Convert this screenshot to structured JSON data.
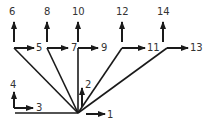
{
  "diagram": {
    "type": "vector-tree",
    "stroke_color": "#1a1a1a",
    "label_color": "#333333",
    "hub": {
      "x": 78,
      "y": 113
    },
    "nodes": [
      {
        "id": "n5",
        "corner": [
          14,
          48
        ],
        "label": "5",
        "h_arrow_to": [
          34,
          48
        ],
        "label_pos": [
          36,
          51
        ],
        "up_label": "6",
        "up_from": [
          14,
          42
        ],
        "up_to": [
          14,
          22
        ],
        "up_label_pos": [
          9,
          15
        ]
      },
      {
        "id": "n7",
        "corner": [
          47,
          48
        ],
        "label": "7",
        "h_arrow_to": [
          68,
          48
        ],
        "label_pos": [
          71,
          51
        ],
        "up_label": "8",
        "up_from": [
          47,
          42
        ],
        "up_to": [
          47,
          22
        ],
        "up_label_pos": [
          44,
          15
        ]
      },
      {
        "id": "n9",
        "corner": [
          78,
          48
        ],
        "label": "9",
        "h_arrow_to": [
          98,
          48
        ],
        "label_pos": [
          101,
          51
        ],
        "up_label": "10",
        "up_from": [
          78,
          42
        ],
        "up_to": [
          78,
          22
        ],
        "up_label_pos": [
          72,
          15
        ]
      },
      {
        "id": "n11",
        "corner": [
          122,
          48
        ],
        "label": "11",
        "h_arrow_to": [
          145,
          48
        ],
        "label_pos": [
          147,
          51
        ],
        "up_label": "12",
        "up_from": [
          122,
          42
        ],
        "up_to": [
          122,
          22
        ],
        "up_label_pos": [
          116,
          15
        ]
      },
      {
        "id": "n13",
        "corner": [
          167,
          48
        ],
        "label": "13",
        "h_arrow_to": [
          188,
          48
        ],
        "label_pos": [
          190,
          51
        ],
        "up_label": "14",
        "up_from": [
          163,
          42
        ],
        "up_to": [
          163,
          22
        ],
        "up_label_pos": [
          157,
          15
        ]
      }
    ],
    "arrows": [
      {
        "label": "1",
        "from": [
          86,
          114
        ],
        "to": [
          105,
          114
        ],
        "label_pos": [
          107,
          118
        ]
      },
      {
        "label": "2",
        "from": [
          82,
          107
        ],
        "to": [
          82,
          88
        ],
        "label_pos": [
          85,
          88
        ]
      },
      {
        "label": "3",
        "from": [
          14,
          108
        ],
        "to": [
          33,
          108
        ],
        "label_pos": [
          36,
          111
        ]
      },
      {
        "label": "4",
        "from": [
          14,
          108
        ],
        "to": [
          14,
          92
        ],
        "label_pos": [
          10,
          88
        ]
      }
    ],
    "baseline": {
      "from": [
        15,
        113
      ],
      "to": [
        78,
        113
      ]
    }
  }
}
